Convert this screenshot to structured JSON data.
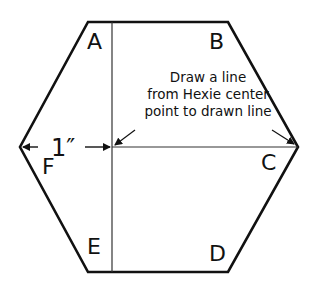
{
  "diagram": {
    "shape": "hexagon",
    "vertex_labels": {
      "A": "A",
      "B": "B",
      "C": "C",
      "D": "D",
      "E": "E",
      "F": "F"
    },
    "instruction": {
      "line1": "Draw a line",
      "line2": "from Hexie center",
      "line3": "point to drawn line"
    },
    "measurement": "1″",
    "colors": {
      "outline": "#111111",
      "inner_line": "#333333",
      "background": "#ffffff"
    }
  }
}
